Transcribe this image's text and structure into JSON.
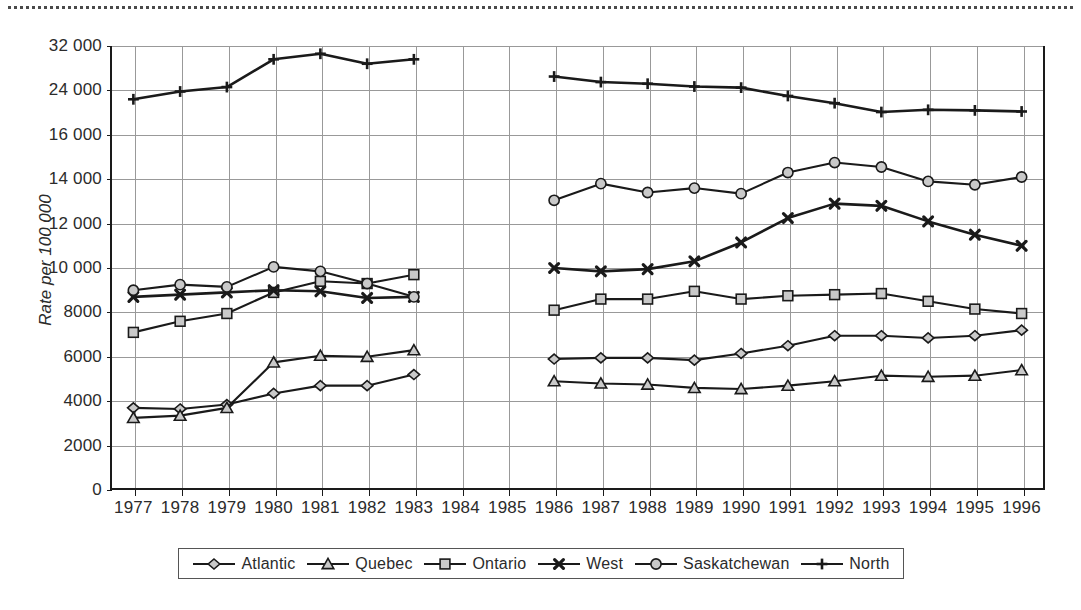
{
  "figure": {
    "top_rule": "dotted-separator",
    "axis_title": "Rate per 100 000"
  },
  "chart_data": {
    "type": "line",
    "title": "",
    "subtitle": "",
    "xlabel": "",
    "ylabel": "Rate per 100 000",
    "grid": true,
    "legend_position": "bottom",
    "x": [
      1977,
      1978,
      1979,
      1980,
      1981,
      1982,
      1983,
      1984,
      1985,
      1986,
      1987,
      1988,
      1989,
      1990,
      1991,
      1992,
      1993,
      1994,
      1995,
      1996
    ],
    "xtick_labels": [
      "1977",
      "1978",
      "1979",
      "1980",
      "1981",
      "1982",
      "1983",
      "1984",
      "1985",
      "1986",
      "1987",
      "1988",
      "1989",
      "1990",
      "1991",
      "1992",
      "1993",
      "1994",
      "1995",
      "1996"
    ],
    "ytick_labels": [
      "32 000",
      "24 000",
      "16 000",
      "14 000",
      "12 000",
      "10 000",
      "8000",
      "6000",
      "4000",
      "2000",
      "0"
    ],
    "ytick_values": [
      32000,
      24000,
      16000,
      14000,
      12000,
      10000,
      8000,
      6000,
      4000,
      2000,
      0
    ],
    "y_axis_note": "broken scale: 0-14000 linear by 2000, then 16000, 24000, 32000",
    "gap_years": [
      1984,
      1985
    ],
    "series": [
      {
        "name": "Atlantic",
        "marker": "diamond",
        "points": [
          {
            "x": 1977,
            "y": 3700
          },
          {
            "x": 1978,
            "y": 3650
          },
          {
            "x": 1979,
            "y": 3850
          },
          {
            "x": 1980,
            "y": 4350
          },
          {
            "x": 1981,
            "y": 4700
          },
          {
            "x": 1982,
            "y": 4700
          },
          {
            "x": 1983,
            "y": 5200
          },
          {
            "x": 1986,
            "y": 5900
          },
          {
            "x": 1987,
            "y": 5950
          },
          {
            "x": 1988,
            "y": 5950
          },
          {
            "x": 1989,
            "y": 5850
          },
          {
            "x": 1990,
            "y": 6150
          },
          {
            "x": 1991,
            "y": 6500
          },
          {
            "x": 1992,
            "y": 6950
          },
          {
            "x": 1993,
            "y": 6950
          },
          {
            "x": 1994,
            "y": 6850
          },
          {
            "x": 1995,
            "y": 6950
          },
          {
            "x": 1996,
            "y": 7200
          }
        ]
      },
      {
        "name": "Quebec",
        "marker": "triangle",
        "points": [
          {
            "x": 1977,
            "y": 3250
          },
          {
            "x": 1978,
            "y": 3350
          },
          {
            "x": 1979,
            "y": 3700
          },
          {
            "x": 1980,
            "y": 5750
          },
          {
            "x": 1981,
            "y": 6050
          },
          {
            "x": 1982,
            "y": 6000
          },
          {
            "x": 1983,
            "y": 6300
          },
          {
            "x": 1986,
            "y": 4900
          },
          {
            "x": 1987,
            "y": 4800
          },
          {
            "x": 1988,
            "y": 4750
          },
          {
            "x": 1989,
            "y": 4600
          },
          {
            "x": 1990,
            "y": 4550
          },
          {
            "x": 1991,
            "y": 4700
          },
          {
            "x": 1992,
            "y": 4900
          },
          {
            "x": 1993,
            "y": 5150
          },
          {
            "x": 1994,
            "y": 5100
          },
          {
            "x": 1995,
            "y": 5150
          },
          {
            "x": 1996,
            "y": 5400
          }
        ]
      },
      {
        "name": "Ontario",
        "marker": "square",
        "points": [
          {
            "x": 1977,
            "y": 7100
          },
          {
            "x": 1978,
            "y": 7600
          },
          {
            "x": 1979,
            "y": 7950
          },
          {
            "x": 1980,
            "y": 8900
          },
          {
            "x": 1981,
            "y": 9400
          },
          {
            "x": 1982,
            "y": 9300
          },
          {
            "x": 1983,
            "y": 9700
          },
          {
            "x": 1986,
            "y": 8100
          },
          {
            "x": 1987,
            "y": 8600
          },
          {
            "x": 1988,
            "y": 8600
          },
          {
            "x": 1989,
            "y": 8950
          },
          {
            "x": 1990,
            "y": 8600
          },
          {
            "x": 1991,
            "y": 8750
          },
          {
            "x": 1992,
            "y": 8800
          },
          {
            "x": 1993,
            "y": 8850
          },
          {
            "x": 1994,
            "y": 8500
          },
          {
            "x": 1995,
            "y": 8150
          },
          {
            "x": 1996,
            "y": 7950
          }
        ]
      },
      {
        "name": "West",
        "marker": "cross",
        "points": [
          {
            "x": 1977,
            "y": 8700
          },
          {
            "x": 1978,
            "y": 8800
          },
          {
            "x": 1979,
            "y": 8900
          },
          {
            "x": 1980,
            "y": 9000
          },
          {
            "x": 1981,
            "y": 8950
          },
          {
            "x": 1982,
            "y": 8650
          },
          {
            "x": 1983,
            "y": 8700
          },
          {
            "x": 1986,
            "y": 10000
          },
          {
            "x": 1987,
            "y": 9850
          },
          {
            "x": 1988,
            "y": 9950
          },
          {
            "x": 1989,
            "y": 10300
          },
          {
            "x": 1990,
            "y": 11150
          },
          {
            "x": 1991,
            "y": 12250
          },
          {
            "x": 1992,
            "y": 12900
          },
          {
            "x": 1993,
            "y": 12800
          },
          {
            "x": 1994,
            "y": 12100
          },
          {
            "x": 1995,
            "y": 11500
          },
          {
            "x": 1996,
            "y": 11000
          }
        ]
      },
      {
        "name": "Saskatchewan",
        "marker": "circle",
        "points": [
          {
            "x": 1977,
            "y": 9000
          },
          {
            "x": 1978,
            "y": 9250
          },
          {
            "x": 1979,
            "y": 9150
          },
          {
            "x": 1980,
            "y": 10050
          },
          {
            "x": 1981,
            "y": 9850
          },
          {
            "x": 1982,
            "y": 9300
          },
          {
            "x": 1983,
            "y": 8700
          },
          {
            "x": 1986,
            "y": 13050
          },
          {
            "x": 1987,
            "y": 13800
          },
          {
            "x": 1988,
            "y": 13400
          },
          {
            "x": 1989,
            "y": 13600
          },
          {
            "x": 1990,
            "y": 13350
          },
          {
            "x": 1991,
            "y": 14300
          },
          {
            "x": 1992,
            "y": 14750
          },
          {
            "x": 1993,
            "y": 14550
          },
          {
            "x": 1994,
            "y": 13900
          },
          {
            "x": 1995,
            "y": 13750
          },
          {
            "x": 1996,
            "y": 14100
          }
        ]
      },
      {
        "name": "North",
        "marker": "plus",
        "points": [
          {
            "x": 1977,
            "y": 22400
          },
          {
            "x": 1978,
            "y": 23800
          },
          {
            "x": 1979,
            "y": 24600
          },
          {
            "x": 1980,
            "y": 29600
          },
          {
            "x": 1981,
            "y": 30600
          },
          {
            "x": 1982,
            "y": 28800
          },
          {
            "x": 1983,
            "y": 29600
          },
          {
            "x": 1986,
            "y": 26500
          },
          {
            "x": 1987,
            "y": 25500
          },
          {
            "x": 1988,
            "y": 25200
          },
          {
            "x": 1989,
            "y": 24700
          },
          {
            "x": 1990,
            "y": 24500
          },
          {
            "x": 1991,
            "y": 23000
          },
          {
            "x": 1992,
            "y": 21700
          },
          {
            "x": 1993,
            "y": 20100
          },
          {
            "x": 1994,
            "y": 20500
          },
          {
            "x": 1995,
            "y": 20400
          },
          {
            "x": 1996,
            "y": 20200
          }
        ]
      }
    ]
  },
  "legend": {
    "items": [
      {
        "label": "Atlantic",
        "marker": "diamond"
      },
      {
        "label": "Quebec",
        "marker": "triangle"
      },
      {
        "label": "Ontario",
        "marker": "square"
      },
      {
        "label": "West",
        "marker": "cross"
      },
      {
        "label": "Saskatchewan",
        "marker": "circle"
      },
      {
        "label": "North",
        "marker": "plus"
      }
    ]
  },
  "colors": {
    "line": "#1a1a1a",
    "marker_fill": "#c9c9c9",
    "grid": "#999999",
    "text": "#2b2b2b"
  }
}
